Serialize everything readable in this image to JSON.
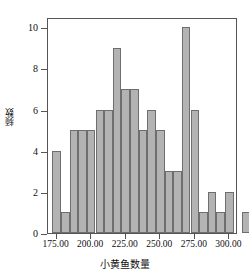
{
  "chart_data": {
    "type": "bar",
    "title": "",
    "subtitle": "",
    "xlabel": "小黄鱼数量",
    "ylabel": "频数",
    "ylim": [
      0,
      10.5
    ],
    "xlim": [
      168.75,
      306.25
    ],
    "grid": false,
    "legend": null,
    "bin_width": 6.25,
    "y_ticks": [
      "0",
      "2",
      "4",
      "6",
      "8",
      "10"
    ],
    "y_tick_values": [
      0,
      2,
      4,
      6,
      8,
      10
    ],
    "x_ticks": [
      "175.00",
      "200.00",
      "225.00",
      "250.00",
      "275.00",
      "300.00"
    ],
    "x_tick_values": [
      175,
      200,
      225,
      250,
      275,
      300
    ],
    "bar_color": "#b3b3b3",
    "bar_edge_color": "#6e6e6e",
    "axis_color": "#555555",
    "bins": [
      {
        "x_start": 171.875,
        "x_end": 178.125,
        "center": 175.0,
        "value": 4
      },
      {
        "x_start": 178.125,
        "x_end": 184.375,
        "center": 181.25,
        "value": 1
      },
      {
        "x_start": 184.375,
        "x_end": 190.625,
        "center": 187.5,
        "value": 5
      },
      {
        "x_start": 190.625,
        "x_end": 196.875,
        "center": 193.75,
        "value": 5
      },
      {
        "x_start": 196.875,
        "x_end": 203.125,
        "center": 200.0,
        "value": 5
      },
      {
        "x_start": 203.125,
        "x_end": 209.375,
        "center": 206.25,
        "value": 6
      },
      {
        "x_start": 209.375,
        "x_end": 215.625,
        "center": 212.5,
        "value": 6
      },
      {
        "x_start": 215.625,
        "x_end": 221.875,
        "center": 218.75,
        "value": 9
      },
      {
        "x_start": 221.875,
        "x_end": 228.125,
        "center": 225.0,
        "value": 7
      },
      {
        "x_start": 228.125,
        "x_end": 234.375,
        "center": 231.25,
        "value": 7
      },
      {
        "x_start": 234.375,
        "x_end": 240.625,
        "center": 237.5,
        "value": 5
      },
      {
        "x_start": 240.625,
        "x_end": 246.875,
        "center": 243.75,
        "value": 6
      },
      {
        "x_start": 246.875,
        "x_end": 253.125,
        "center": 250.0,
        "value": 5
      },
      {
        "x_start": 253.125,
        "x_end": 259.375,
        "center": 256.25,
        "value": 3
      },
      {
        "x_start": 259.375,
        "x_end": 265.625,
        "center": 262.5,
        "value": 3
      },
      {
        "x_start": 265.625,
        "x_end": 271.875,
        "center": 268.75,
        "value": 10
      },
      {
        "x_start": 271.875,
        "x_end": 278.125,
        "center": 275.0,
        "value": 6
      },
      {
        "x_start": 278.125,
        "x_end": 284.375,
        "center": 281.25,
        "value": 1
      },
      {
        "x_start": 284.375,
        "x_end": 290.625,
        "center": 287.5,
        "value": 2
      },
      {
        "x_start": 290.625,
        "x_end": 296.875,
        "center": 293.75,
        "value": 1
      },
      {
        "x_start": 296.875,
        "x_end": 303.125,
        "center": 300.0,
        "value": 2
      },
      {
        "x_start": 303.125,
        "x_end": 309.375,
        "center": 306.25,
        "value": 0
      },
      {
        "x_start": 309.375,
        "x_end": 315.625,
        "center": 312.5,
        "value": 1
      }
    ],
    "categories": [
      "175.00",
      "181.25",
      "187.50",
      "193.75",
      "200.00",
      "206.25",
      "212.50",
      "218.75",
      "225.00",
      "231.25",
      "237.50",
      "243.75",
      "250.00",
      "256.25",
      "262.50",
      "268.75",
      "275.00",
      "281.25",
      "287.50",
      "293.75",
      "300.00",
      "306.25",
      "312.50"
    ],
    "values": [
      4,
      1,
      5,
      5,
      5,
      6,
      6,
      9,
      7,
      7,
      5,
      6,
      5,
      3,
      3,
      10,
      6,
      1,
      2,
      1,
      2,
      0,
      1
    ]
  }
}
